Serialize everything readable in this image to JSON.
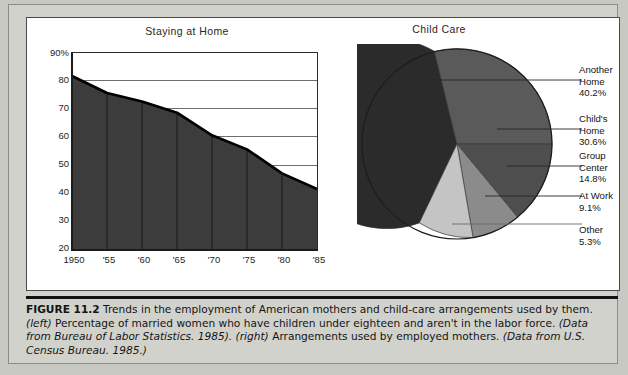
{
  "figure": {
    "number_label": "FIGURE 11.2",
    "caption_segments": [
      {
        "text": "FIGURE 11.2",
        "style": "bold"
      },
      {
        "text": "  Trends in the employment of American mothers and child-care arrangements used by them. ",
        "style": "normal"
      },
      {
        "text": "(left)",
        "style": "italic"
      },
      {
        "text": " Percentage of married women who have children under eighteen and aren't in the labor force. ",
        "style": "normal"
      },
      {
        "text": "(Data from Bureau of Labor Statistics. 1985).",
        "style": "italic"
      },
      {
        "text": " ",
        "style": "normal"
      },
      {
        "text": "(right)",
        "style": "italic"
      },
      {
        "text": " Arrangements used by employed mothers. ",
        "style": "normal"
      },
      {
        "text": "(Data from U.S. Census Bureau. 1985.)",
        "style": "italic"
      }
    ],
    "caption_plain": "FIGURE 11.2  Trends in the employment of American mothers and child-care arrangements used by them. (left) Percentage of married women who have children under eighteen and aren't in the labor force. (Data from Bureau of Labor Statistics. 1985). (right) Arrangements used by employed mothers. (Data from U.S. Census Bureau. 1985.)"
  },
  "chart_data": [
    {
      "type": "area",
      "title": "Staying at Home",
      "xlabel": "",
      "ylabel": "",
      "x": [
        1950,
        1955,
        1960,
        1965,
        1970,
        1975,
        1980,
        1985
      ],
      "categories": [
        "1950",
        "'55",
        "'60",
        "'65",
        "'70",
        "'75",
        "'80",
        "'85"
      ],
      "values": [
        81.5,
        75.5,
        72.5,
        68.5,
        60.5,
        55.5,
        47.0,
        41.5
      ],
      "ylim": [
        20,
        90
      ],
      "yticks": [
        20,
        30,
        40,
        50,
        60,
        70,
        80,
        90
      ],
      "ytick_labels": [
        "20",
        "30",
        "40",
        "50",
        "60",
        "70",
        "80",
        "90%"
      ],
      "grid": true,
      "grid_axis": "y",
      "legend": false,
      "fill_color": "#3a3a3a",
      "line_color": "#000000"
    },
    {
      "type": "pie",
      "title": "Child Care",
      "labels": [
        "Another Home",
        "Child's Home",
        "Group Center",
        "At Work",
        "Other"
      ],
      "values": [
        40.2,
        30.6,
        14.8,
        9.1,
        5.3
      ],
      "value_labels": [
        "40.2%",
        "30.6%",
        "14.8%",
        "9.1%",
        "5.3%"
      ],
      "colors": [
        "#2b2b2b",
        "#5c5c5c",
        "#4f4f4f",
        "#8d8d8d",
        "#c2c2c2"
      ],
      "legend": "callout-right",
      "grid": false
    }
  ],
  "pie_callouts": [
    {
      "name": "Another Home",
      "pct": "40.2%"
    },
    {
      "name": "Child's Home",
      "pct": "30.6%"
    },
    {
      "name": "Group Center",
      "pct": "14.8%"
    },
    {
      "name": "At Work",
      "pct": "9.1%"
    },
    {
      "name": "Other",
      "pct": "5.3%"
    }
  ],
  "pie_callout_lines": {
    "another_home_l1": "Another",
    "another_home_l2": "Home",
    "another_home_pct": "40.2%",
    "childs_home_l1": "Child's",
    "childs_home_l2": "Home",
    "childs_home_pct": "30.6%",
    "group_center_l1": "Group",
    "group_center_l2": "Center",
    "group_center_pct": "14.8%",
    "at_work_l1": "At Work",
    "at_work_pct": "9.1%",
    "other_l1": "Other",
    "other_pct": "5.3%"
  }
}
